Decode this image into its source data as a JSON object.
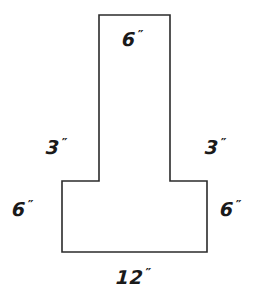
{
  "figure": {
    "units": "inches",
    "stroke_color": "#2b2b2b",
    "fill_color": "#ffffff",
    "background_color": "#ffffff",
    "stroke_width": 1.6,
    "outline_points": "99,15 170,15 170,181 207,181 207,252 62,252 62,181 99,181",
    "labels": {
      "top": {
        "value": "6",
        "unit": "″",
        "full": "6″",
        "edge": "top-of-stem"
      },
      "left_upper": {
        "value": "3",
        "unit": "″",
        "full": "3″",
        "edge": "left-of-stem"
      },
      "right_upper": {
        "value": "3",
        "unit": "″",
        "full": "3″",
        "edge": "right-of-stem"
      },
      "left_lower": {
        "value": "6",
        "unit": "″",
        "full": "6″",
        "edge": "left-of-base"
      },
      "right_lower": {
        "value": "6",
        "unit": "″",
        "full": "6″",
        "edge": "right-of-base"
      },
      "bottom": {
        "value": "12",
        "unit": "″",
        "full": "12″",
        "edge": "bottom-of-base"
      }
    }
  }
}
